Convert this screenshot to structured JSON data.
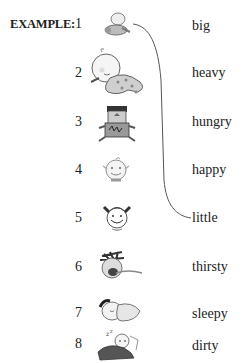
{
  "example_label": "EXAMPLE:",
  "items": [
    {
      "number": "1",
      "picture": "small-baby-flying-icon"
    },
    {
      "number": "2",
      "picture": "big-baby-polka-dot-icon"
    },
    {
      "number": "3",
      "picture": "child-with-dessert-icon"
    },
    {
      "number": "4",
      "picture": "smiling-baby-face-icon"
    },
    {
      "number": "5",
      "picture": "girl-pigtails-face-icon"
    },
    {
      "number": "6",
      "picture": "child-tongue-out-icon"
    },
    {
      "number": "7",
      "picture": "baby-sleeping-icon"
    },
    {
      "number": "8",
      "picture": "baby-in-bed-zzz-icon"
    }
  ],
  "words": [
    "big",
    "heavy",
    "hungry",
    "happy",
    "little",
    "thirsty",
    "sleepy",
    "dirty"
  ],
  "example_match": {
    "from": "1",
    "to": "little"
  },
  "colors": {
    "text": "#222222",
    "line": "#555555",
    "background": "#ffffff"
  }
}
